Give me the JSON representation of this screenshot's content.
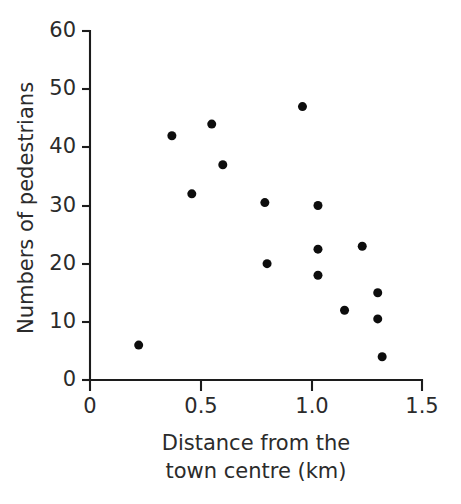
{
  "chart_data": {
    "type": "scatter",
    "title": "",
    "xlabel": "Distance from the town centre (km)",
    "ylabel": "Numbers of pedestrians",
    "xlabel_line1": "Distance from the",
    "xlabel_line2": "town centre (km)",
    "xlim": [
      0,
      1.5
    ],
    "ylim": [
      0,
      60
    ],
    "xticks": [
      0,
      0.5,
      1.0,
      1.5
    ],
    "xtick_labels": [
      "0",
      "0.5",
      "1.0",
      "1.5"
    ],
    "yticks": [
      0,
      10,
      20,
      30,
      40,
      50,
      60
    ],
    "ytick_labels": [
      "0",
      "10",
      "20",
      "30",
      "40",
      "50",
      "60"
    ],
    "grid": false,
    "legend": null,
    "marker": "filled-circle",
    "marker_color": "#0d0d0d",
    "marker_size_px": 9,
    "n_points": 16,
    "points": [
      {
        "x": 0.22,
        "y": 6
      },
      {
        "x": 0.37,
        "y": 42
      },
      {
        "x": 0.46,
        "y": 32
      },
      {
        "x": 0.55,
        "y": 44
      },
      {
        "x": 0.6,
        "y": 37
      },
      {
        "x": 0.79,
        "y": 30.5
      },
      {
        "x": 0.8,
        "y": 20
      },
      {
        "x": 0.96,
        "y": 47
      },
      {
        "x": 1.03,
        "y": 30
      },
      {
        "x": 1.03,
        "y": 22.5
      },
      {
        "x": 1.03,
        "y": 18
      },
      {
        "x": 1.15,
        "y": 12
      },
      {
        "x": 1.23,
        "y": 23
      },
      {
        "x": 1.3,
        "y": 15
      },
      {
        "x": 1.3,
        "y": 10.5
      },
      {
        "x": 1.32,
        "y": 4
      }
    ],
    "x": [
      0.22,
      0.37,
      0.46,
      0.55,
      0.6,
      0.79,
      0.8,
      0.96,
      1.03,
      1.03,
      1.03,
      1.15,
      1.23,
      1.3,
      1.3,
      1.32
    ],
    "y": [
      6,
      42,
      32,
      44,
      37,
      30.5,
      20,
      47,
      30,
      22.5,
      18,
      12,
      23,
      15,
      10.5,
      4
    ]
  },
  "layout": {
    "plot_left_px": 90,
    "plot_bottom_px": 380,
    "plot_right_px": 422,
    "plot_top_px": 31,
    "background": "#ffffff",
    "axis_color": "#1c1c1c"
  }
}
